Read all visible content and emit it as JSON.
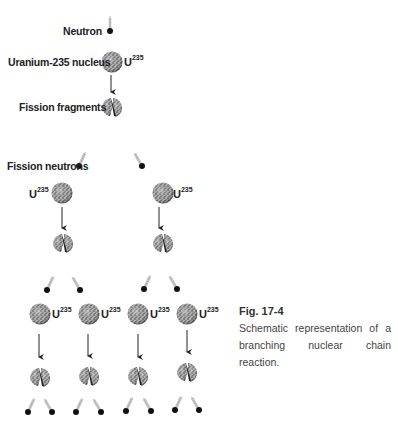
{
  "labels": {
    "neutron": "Neutron",
    "uranium_nucleus": "Uranium-235 nucleus",
    "fission_fragments": "Fission fragments",
    "fission_neutrons": "Fission neutrons",
    "isotope_symbol": "U",
    "isotope_mass": "235"
  },
  "caption": {
    "title": "Fig. 17-4",
    "text": "Schematic representation of a branching nuclear chain reaction."
  },
  "diagram": {
    "generations": [
      {
        "level": 1,
        "nuclei": 1,
        "neutrons_released": 2
      },
      {
        "level": 2,
        "nuclei": 2,
        "neutrons_released": 4
      },
      {
        "level": 3,
        "nuclei": 4,
        "neutrons_released": 8
      }
    ]
  }
}
